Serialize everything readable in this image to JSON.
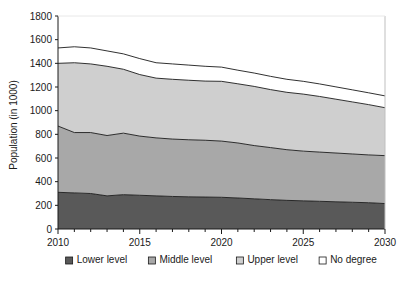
{
  "chart_data": {
    "type": "area",
    "stacked": true,
    "title": "",
    "xlabel": "",
    "ylabel": "Population (in 1000)",
    "xlim": [
      2010,
      2030
    ],
    "ylim": [
      0,
      1800
    ],
    "ytick_step": 200,
    "grid": false,
    "legend_position": "bottom",
    "x": [
      2010,
      2011,
      2012,
      2013,
      2014,
      2015,
      2016,
      2017,
      2018,
      2019,
      2020,
      2021,
      2022,
      2023,
      2024,
      2025,
      2026,
      2027,
      2028,
      2029,
      2030
    ],
    "yticks": [
      0,
      200,
      400,
      600,
      800,
      1000,
      1200,
      1400,
      1600,
      1800
    ],
    "ytick_labels": [
      "0",
      "200",
      "400",
      "600",
      "800",
      "1000",
      "1200",
      "1400",
      "1600",
      "1800"
    ],
    "xticks": [
      2010,
      2015,
      2020,
      2025,
      2030
    ],
    "xtick_labels": [
      "2010",
      "2015",
      "2020",
      "2025",
      "2030"
    ],
    "series": [
      {
        "name": "Lower level",
        "color": "#595959",
        "values": [
          310,
          305,
          300,
          280,
          290,
          285,
          280,
          275,
          272,
          270,
          268,
          262,
          255,
          248,
          242,
          238,
          234,
          230,
          226,
          222,
          215
        ]
      },
      {
        "name": "Middle level",
        "color": "#a8a8a8",
        "values": [
          560,
          510,
          515,
          510,
          520,
          500,
          490,
          485,
          482,
          480,
          475,
          465,
          450,
          440,
          428,
          420,
          416,
          412,
          408,
          404,
          405
        ]
      },
      {
        "name": "Upper level",
        "color": "#cfcfcf",
        "values": [
          530,
          590,
          580,
          585,
          540,
          520,
          505,
          505,
          503,
          500,
          505,
          500,
          500,
          490,
          485,
          482,
          470,
          455,
          440,
          425,
          405
        ]
      },
      {
        "name": "No degree",
        "color": "#ffffff",
        "values": [
          130,
          135,
          135,
          130,
          130,
          135,
          130,
          130,
          128,
          125,
          120,
          115,
          113,
          112,
          110,
          108,
          106,
          104,
          102,
          100,
          100
        ]
      }
    ],
    "cumulative_tops": {
      "Lower level": [
        310,
        305,
        300,
        280,
        290,
        285,
        280,
        275,
        272,
        270,
        268,
        262,
        255,
        248,
        242,
        238,
        234,
        230,
        226,
        222,
        215
      ],
      "Middle level": [
        870,
        815,
        815,
        790,
        810,
        785,
        770,
        760,
        754,
        750,
        743,
        727,
        705,
        688,
        670,
        658,
        650,
        642,
        634,
        626,
        620
      ],
      "Upper level": [
        1400,
        1405,
        1395,
        1375,
        1350,
        1305,
        1275,
        1265,
        1257,
        1250,
        1248,
        1227,
        1205,
        1178,
        1155,
        1140,
        1120,
        1097,
        1074,
        1051,
        1025
      ],
      "No degree": [
        1530,
        1540,
        1530,
        1505,
        1480,
        1440,
        1405,
        1395,
        1385,
        1375,
        1368,
        1342,
        1318,
        1290,
        1265,
        1248,
        1226,
        1201,
        1176,
        1151,
        1125
      ]
    }
  },
  "legend": {
    "items": [
      {
        "label": "Lower level",
        "color": "#595959"
      },
      {
        "label": "Middle level",
        "color": "#a8a8a8"
      },
      {
        "label": "Upper level",
        "color": "#cfcfcf"
      },
      {
        "label": "No degree",
        "color": "#ffffff"
      }
    ]
  }
}
